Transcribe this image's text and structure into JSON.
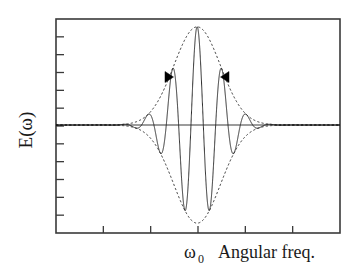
{
  "figure": {
    "background_color": "#ffffff",
    "line_color": "#2b2b2b",
    "marker_color": "#000000"
  },
  "axes": {
    "ylabel": "E(ω)",
    "xlabel_center": "ω",
    "xlabel_center_sub": "0",
    "xlabel_right": "Angular freq.",
    "frame": {
      "left": 56,
      "right": 340,
      "top": 19,
      "bottom": 233
    },
    "zero_line_y": 125,
    "y_tick_count": 11,
    "x_tick_count": 5
  },
  "annotations": [
    {
      "name": "left-arrow-marker",
      "glyph": "▶",
      "x": 172,
      "y": 77,
      "direction": "right"
    },
    {
      "name": "right-arrow-marker",
      "glyph": "◀",
      "x": 222,
      "y": 77,
      "direction": "left"
    }
  ],
  "chart_data": {
    "type": "line",
    "title": "",
    "xlabel": "Angular freq.",
    "ylabel": "E(ω)",
    "grid": false,
    "legend": false,
    "x": [
      0.0,
      0.02,
      0.04,
      0.06,
      0.08,
      0.1,
      0.12,
      0.14,
      0.16,
      0.18,
      0.2,
      0.22,
      0.24,
      0.26,
      0.28,
      0.3,
      0.32,
      0.34,
      0.36,
      0.38,
      0.4,
      0.42,
      0.44,
      0.46,
      0.48,
      0.5,
      0.52,
      0.54,
      0.56,
      0.58,
      0.6,
      0.62,
      0.64,
      0.66,
      0.68,
      0.7,
      0.72,
      0.74,
      0.76,
      0.78,
      0.8,
      0.82,
      0.84,
      0.86,
      0.88,
      0.9,
      0.92,
      0.94,
      0.96,
      0.98,
      1.0
    ],
    "xlim": [
      0,
      1
    ],
    "ylim": [
      -1.08,
      1.08
    ],
    "center_x": 0.497,
    "carrier_cycles": 11.5,
    "envelope_sigma": 0.082,
    "series": [
      {
        "name": "E(omega) wave packet",
        "style": "solid",
        "role": "carrier"
      },
      {
        "name": "upper envelope",
        "style": "dashed",
        "role": "envelope-upper"
      },
      {
        "name": "lower envelope",
        "style": "dashed",
        "role": "envelope-lower"
      }
    ],
    "tick_labels": {
      "x": [
        "",
        "",
        "ω₀",
        "",
        ""
      ],
      "y": []
    }
  }
}
